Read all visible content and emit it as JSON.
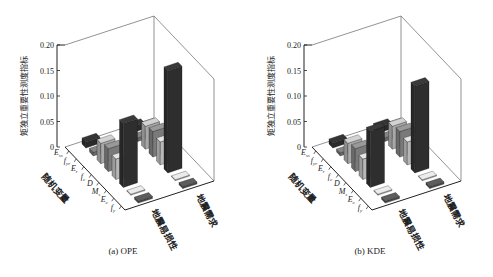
{
  "chart_data": [
    {
      "type": "bar",
      "subtype": "3d-bar",
      "title": "(a) OPE",
      "zlabel": "矩独立重要性测度指标",
      "xlabel": "随机变量",
      "categories": [
        "Eₛₛ",
        "f_yr",
        "E_r",
        "f_c",
        "D",
        "Mₛ",
        "E_c",
        "f_y"
      ],
      "category_labels": [
        "E",
        "f",
        "E",
        "f",
        "D",
        "M",
        "E",
        "f"
      ],
      "category_subs": [
        "ss",
        "yr",
        "r",
        "c",
        "",
        "s",
        "c",
        "y"
      ],
      "rows": [
        "地震易损性",
        "地震需求"
      ],
      "series": [
        {
          "name": "地震易损性",
          "values": [
            0.012,
            0.007,
            0.04,
            0.045,
            0.04,
            0.125,
            0.002,
            0.004
          ]
        },
        {
          "name": "地震需求",
          "values": [
            0.012,
            0.007,
            0.045,
            0.05,
            0.045,
            0.2,
            0.002,
            0.004
          ]
        }
      ],
      "zlim": [
        0,
        0.2
      ],
      "zticks": [
        "0",
        "0.05",
        "0.10",
        "0.15",
        "0.20"
      ],
      "colors": [
        "#2a2a2a",
        "#6a6a6a",
        "#a8a8a8",
        "#7a7a7a",
        "#b8b8b8",
        "#2e2e2e",
        "#bdbdbd",
        "#4a4a4a"
      ],
      "grid": false
    },
    {
      "type": "bar",
      "subtype": "3d-bar",
      "title": "(b) KDE",
      "zlabel": "矩独立重要性测度指标",
      "xlabel": "随机变量",
      "categories": [
        "Eₛₛ",
        "f_yr",
        "E_r",
        "f_c",
        "D",
        "Mₛ",
        "E_c",
        "f_y"
      ],
      "category_labels": [
        "E",
        "f",
        "E",
        "f",
        "D",
        "M",
        "E",
        "f"
      ],
      "category_subs": [
        "ss",
        "yr",
        "r",
        "c",
        "",
        "s",
        "c",
        "y"
      ],
      "rows": [
        "地震易损性",
        "地震需求"
      ],
      "series": [
        {
          "name": "地震易损性",
          "values": [
            0.01,
            0.006,
            0.04,
            0.045,
            0.04,
            0.11,
            0.002,
            0.004
          ]
        },
        {
          "name": "地震需求",
          "values": [
            0.012,
            0.007,
            0.045,
            0.05,
            0.045,
            0.17,
            0.002,
            0.004
          ]
        }
      ],
      "zlim": [
        0,
        0.2
      ],
      "zticks": [
        "0",
        "0.05",
        "0.10",
        "0.15",
        "0.20"
      ],
      "colors": [
        "#2a2a2a",
        "#6a6a6a",
        "#a8a8a8",
        "#7a7a7a",
        "#b8b8b8",
        "#2e2e2e",
        "#bdbdbd",
        "#4a4a4a"
      ],
      "grid": false
    }
  ],
  "captions": [
    "(a) OPE",
    "(b) KDE"
  ]
}
